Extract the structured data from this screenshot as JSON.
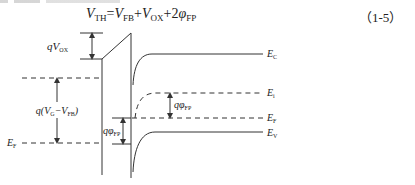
{
  "equation": {
    "lhs_var": "V",
    "lhs_sub": "TH",
    "eq": "=",
    "t1_var": "V",
    "t1_sub": "FB",
    "plus1": "+",
    "t2_var": "V",
    "t2_sub": "OX",
    "plus2": "+2",
    "t3_var": "φ",
    "t3_sub": "FP",
    "number": "（1-5）"
  },
  "diagram": {
    "labels": {
      "qVox": {
        "main": "qV",
        "sub": "OX"
      },
      "qVgVfb": {
        "pre": "q(V",
        "sub1": "G",
        "mid": "−V",
        "sub2": "FB",
        "post": ")"
      },
      "ef_left": {
        "main": "E",
        "sub": "F"
      },
      "qphi_left": {
        "main": "qφ",
        "sub": "FP"
      },
      "qphi_right": {
        "main": "qφ",
        "sub": "FP"
      },
      "ec": {
        "main": "E",
        "sub": "C"
      },
      "ei": {
        "main": "E",
        "sub": "i"
      },
      "ef_right": {
        "main": "E",
        "sub": "F"
      },
      "ev": {
        "main": "E",
        "sub": "V"
      }
    },
    "colors": {
      "line": "#333333",
      "background": "#ffffff"
    }
  }
}
